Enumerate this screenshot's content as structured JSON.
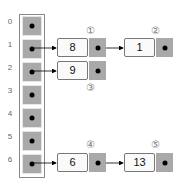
{
  "diagram": {
    "type": "hash-table-chaining",
    "indices": [
      "0",
      "1",
      "2",
      "3",
      "4",
      "5",
      "6"
    ],
    "nodes": [
      {
        "id": "n1",
        "value": "8",
        "label": "①",
        "bucket": 1
      },
      {
        "id": "n2",
        "value": "1",
        "label": "②",
        "bucket": 1
      },
      {
        "id": "n3",
        "value": "9",
        "label": "③",
        "bucket": 2
      },
      {
        "id": "n4",
        "value": "6",
        "label": "④",
        "bucket": 6
      },
      {
        "id": "n5",
        "value": "13",
        "label": "⑤",
        "bucket": 6
      }
    ],
    "colors": {
      "pointer_cell": "#a9a9a9",
      "value_cell": "#fafafa",
      "arrow": "#000000"
    }
  }
}
